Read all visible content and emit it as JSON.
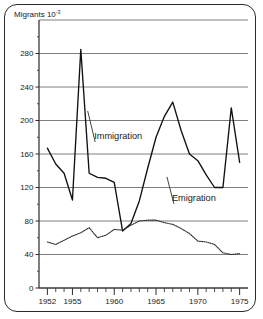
{
  "figure": {
    "axis_title": "Migrants 10",
    "axis_title_superscript": "-3",
    "border_color": "#2b2b2b",
    "background": "#ffffff"
  },
  "annotations": [
    {
      "name": "immigration-label",
      "text": "Immigration",
      "x": 1957.6,
      "y": 178
    },
    {
      "name": "emigration-label",
      "text": "Emigration",
      "x": 1966.9,
      "y": 104
    }
  ],
  "chart_data": {
    "type": "line",
    "xlabel": "",
    "ylabel": "Migrants 10^-3",
    "xlim": [
      1951,
      1976
    ],
    "ylim": [
      0,
      320
    ],
    "yticks": [
      0,
      40,
      80,
      120,
      160,
      200,
      240,
      280
    ],
    "ytick_labels": [
      "0",
      "40",
      "80",
      "120",
      "160",
      "200",
      "240",
      "280"
    ],
    "y_gridlines": [
      40,
      80,
      120,
      160,
      200,
      240,
      280,
      320
    ],
    "xticks": [
      1952,
      1953,
      1954,
      1955,
      1956,
      1957,
      1958,
      1959,
      1960,
      1961,
      1962,
      1963,
      1964,
      1965,
      1966,
      1967,
      1968,
      1969,
      1970,
      1971,
      1972,
      1973,
      1974,
      1975
    ],
    "xtick_labels_shown": [
      "1952",
      "1955",
      "1960",
      "1965",
      "1970",
      "1975"
    ],
    "xtick_labeled_years": [
      1952,
      1955,
      1960,
      1965,
      1970,
      1975
    ],
    "grid": true,
    "legend_position": "inline-annotation",
    "x": [
      1952,
      1953,
      1954,
      1955,
      1956,
      1957,
      1958,
      1959,
      1960,
      1961,
      1962,
      1963,
      1964,
      1965,
      1966,
      1967,
      1968,
      1969,
      1970,
      1971,
      1972,
      1973,
      1974,
      1975
    ],
    "series": [
      {
        "name": "Immigration",
        "style": "solid",
        "values": [
          167,
          148,
          137,
          105,
          285,
          137,
          132,
          131,
          126,
          68,
          77,
          104,
          143,
          180,
          205,
          222,
          188,
          160,
          152,
          135,
          120,
          120,
          215,
          150
        ]
      },
      {
        "name": "Emigration",
        "style": "dotted",
        "values": [
          55,
          52,
          57,
          62,
          66,
          72,
          60,
          63,
          70,
          69,
          75,
          80,
          81,
          81,
          78,
          76,
          71,
          65,
          56,
          55,
          52,
          42,
          40,
          41
        ]
      }
    ]
  }
}
